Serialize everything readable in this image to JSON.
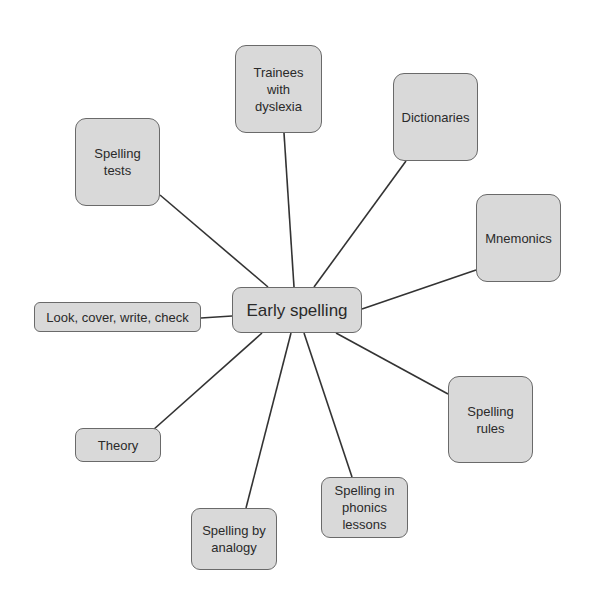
{
  "diagram": {
    "type": "mind-map",
    "colors": {
      "node_fill": "#d9d9d9",
      "node_border": "#6a6a6a",
      "link": "#333333",
      "text": "#2a2a2a"
    },
    "center": {
      "label": "Early spelling"
    },
    "branches": [
      {
        "id": "trainees",
        "label": "Trainees with dyslexia"
      },
      {
        "id": "dictionaries",
        "label": "Dictionaries"
      },
      {
        "id": "spelling-tests",
        "label": "Spelling tests"
      },
      {
        "id": "mnemonics",
        "label": "Mnemonics"
      },
      {
        "id": "look-cover",
        "label": "Look, cover, write, check"
      },
      {
        "id": "spelling-rules",
        "label": "Spelling rules"
      },
      {
        "id": "theory",
        "label": "Theory"
      },
      {
        "id": "phonics",
        "label": "Spelling in phonics lessons"
      },
      {
        "id": "analogy",
        "label": "Spelling by analogy"
      }
    ]
  }
}
